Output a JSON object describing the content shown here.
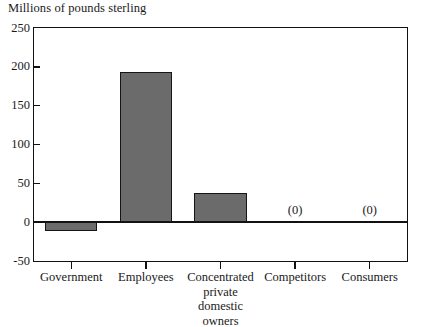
{
  "chart_data": {
    "type": "bar",
    "title": "Millions of pounds sterling",
    "xlabel": "",
    "ylabel": "Millions of pounds sterling",
    "ylim": [
      -50,
      250
    ],
    "yticks": [
      250,
      200,
      150,
      100,
      50,
      0,
      -50
    ],
    "ytick_labels": [
      "250",
      "200",
      "150",
      "100",
      "50",
      "0",
      "-50"
    ],
    "grid": false,
    "legend": false,
    "categories": [
      "Government",
      "Employees",
      "Concentrated private domestic owners",
      "Competitors",
      "Consumers"
    ],
    "category_label_lines": [
      [
        "Government"
      ],
      [
        "Employees"
      ],
      [
        "Concentrated",
        "private",
        "domestic",
        "owners"
      ],
      [
        "Competitors"
      ],
      [
        "Consumers"
      ]
    ],
    "values": [
      -12,
      193,
      38,
      0,
      0
    ],
    "annotations": [
      {
        "category": "Competitors",
        "text": "(0)"
      },
      {
        "category": "Consumers",
        "text": "(0)"
      }
    ],
    "bar_color": "#6b6b6b",
    "bar_edge_color": "#151515",
    "axis_color": "#111111",
    "background_color": "#ffffff"
  }
}
